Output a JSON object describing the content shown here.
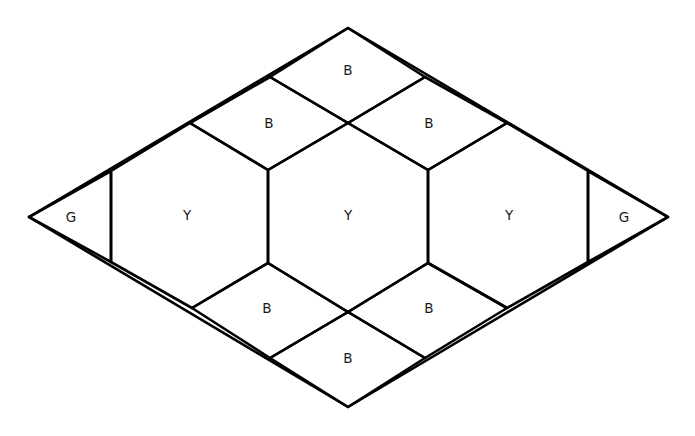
{
  "figure": {
    "background_color": "#ffffff",
    "stroke_color": "#000000",
    "label_color": "#1a1a1a",
    "stroke_width": 2.6,
    "label_font_size": 13.5,
    "width": 695,
    "height": 436
  },
  "chart_data": {
    "type": "diagram",
    "piece_legend": {
      "G": "green triangle",
      "Y": "yellow hexagon",
      "B": "blue rhombus"
    },
    "piece_counts": {
      "G": 2,
      "Y": 3,
      "B": 6
    },
    "outline": {
      "name": "large-rhombus-outline",
      "points": "29,217 348,28 668,217 348,407"
    },
    "key_vertices": {
      "left_apex": [
        29,
        217
      ],
      "right_apex": [
        668,
        217
      ],
      "top_apex": [
        348,
        28
      ],
      "bottom_apex": [
        348,
        407
      ],
      "upper_left_node": [
        190,
        123
      ],
      "upper_right_node": [
        507,
        123
      ],
      "lower_left_node": [
        192,
        308
      ],
      "lower_right_node": [
        507,
        308
      ],
      "top_left_mid": [
        270,
        77
      ],
      "top_right_mid": [
        425,
        77
      ],
      "bottom_left_mid": [
        270,
        358
      ],
      "bottom_right_mid": [
        425,
        358
      ],
      "top_cross": [
        348,
        123
      ],
      "bottom_cross": [
        348,
        312
      ],
      "left_tri_top": [
        111,
        171
      ],
      "left_tri_bottom": [
        111,
        262
      ],
      "right_tri_top": [
        588,
        171
      ],
      "right_tri_bottom": [
        588,
        262
      ],
      "hex1_vert_top": [
        268,
        170
      ],
      "hex1_vert_bottom": [
        268,
        263
      ],
      "hex2_vert_top": [
        428,
        170
      ],
      "hex2_vert_bottom": [
        428,
        263
      ]
    }
  },
  "tiles": [
    {
      "id": "tile-g-left",
      "name": "green-triangle-left",
      "label": "G",
      "label_x": 71,
      "label_y": 218,
      "points": "29,217 111,171 111,262"
    },
    {
      "id": "tile-g-right",
      "name": "green-triangle-right",
      "label": "G",
      "label_x": 624,
      "label_y": 218,
      "points": "668,217 588,171 588,262"
    },
    {
      "id": "tile-y-left",
      "name": "yellow-hexagon-left",
      "label": "Y",
      "label_x": 187,
      "label_y": 216,
      "points": "111,171 190,123 268,170 268,263 192,308 111,262"
    },
    {
      "id": "tile-y-center",
      "name": "yellow-hexagon-center",
      "label": "Y",
      "label_x": 348,
      "label_y": 216,
      "points": "268,170 348,123 428,170 428,263 348,312 268,263"
    },
    {
      "id": "tile-y-right",
      "name": "yellow-hexagon-right",
      "label": "Y",
      "label_x": 509,
      "label_y": 216,
      "points": "428,170 507,123 588,171 588,262 507,308 428,263"
    },
    {
      "id": "tile-b-top",
      "name": "blue-rhombus-top",
      "label": "B",
      "label_x": 348,
      "label_y": 71,
      "points": "348,28 425,77 348,123 270,77"
    },
    {
      "id": "tile-b-upper-left",
      "name": "blue-rhombus-upper-left",
      "label": "B",
      "label_x": 269,
      "label_y": 124,
      "points": "270,77 348,123 268,170 190,123"
    },
    {
      "id": "tile-b-upper-right",
      "name": "blue-rhombus-upper-right",
      "label": "B",
      "label_x": 429,
      "label_y": 124,
      "points": "425,77 507,123 428,170 348,123"
    },
    {
      "id": "tile-b-lower-left",
      "name": "blue-rhombus-lower-left",
      "label": "B",
      "label_x": 267,
      "label_y": 309,
      "points": "268,263 348,312 270,358 192,308"
    },
    {
      "id": "tile-b-lower-right",
      "name": "blue-rhombus-lower-right",
      "label": "B",
      "label_x": 429,
      "label_y": 309,
      "points": "428,263 507,308 425,358 348,312"
    },
    {
      "id": "tile-b-bottom",
      "name": "blue-rhombus-bottom",
      "label": "B",
      "label_x": 348,
      "label_y": 359,
      "points": "348,312 425,358 348,407 270,358"
    }
  ]
}
